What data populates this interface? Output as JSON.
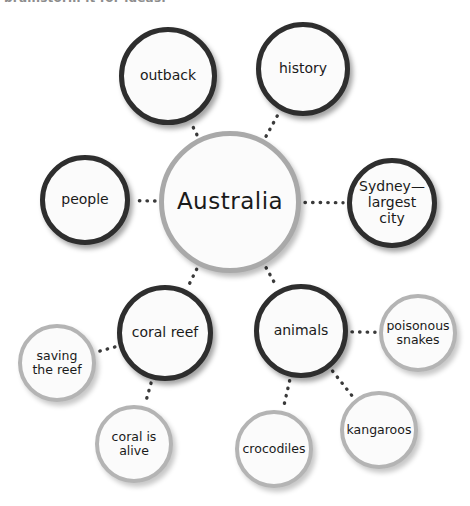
{
  "header": {
    "cropped_text": "brainstorm it for ideas."
  },
  "canvas": {
    "width": 470,
    "height": 506,
    "background": "#ffffff"
  },
  "style": {
    "center_border_color": "#a9a9a9",
    "primary_border_color": "#2e2e2e",
    "leaf_border_color": "#b4b4b4",
    "node_fill": "#fbfbfb",
    "connector_color": "#3a3a3a",
    "text_color": "#1a1a1a"
  },
  "diagram": {
    "type": "mind-map",
    "title": "Australia",
    "nodes": [
      {
        "id": "center",
        "label": "Australia",
        "tier": "center",
        "cx": 230,
        "cy": 202,
        "r": 71
      },
      {
        "id": "outback",
        "label": "outback",
        "tier": "primary",
        "cx": 168,
        "cy": 76,
        "r": 49
      },
      {
        "id": "history",
        "label": "history",
        "tier": "primary",
        "cx": 303,
        "cy": 69,
        "r": 47
      },
      {
        "id": "people",
        "label": "people",
        "tier": "primary",
        "cx": 85,
        "cy": 200,
        "r": 45
      },
      {
        "id": "sydney",
        "label": "Sydney—\nlargest city",
        "tier": "primary",
        "cx": 392,
        "cy": 203,
        "r": 45
      },
      {
        "id": "coralreef",
        "label": "coral reef",
        "tier": "primary",
        "cx": 165,
        "cy": 333,
        "r": 48
      },
      {
        "id": "animals",
        "label": "animals",
        "tier": "primary",
        "cx": 301,
        "cy": 331,
        "r": 47
      },
      {
        "id": "saving",
        "label": "saving\nthe reef",
        "tier": "leaf",
        "cx": 57,
        "cy": 363,
        "r": 39
      },
      {
        "id": "coralalive",
        "label": "coral is\nalive",
        "tier": "leaf",
        "cx": 134,
        "cy": 444,
        "r": 39
      },
      {
        "id": "crocodiles",
        "label": "crocodiles",
        "tier": "leaf",
        "cx": 274,
        "cy": 449,
        "r": 39
      },
      {
        "id": "kangaroos",
        "label": "kangaroos",
        "tier": "leaf",
        "cx": 379,
        "cy": 430,
        "r": 39
      },
      {
        "id": "snakes",
        "label": "poisonous\nsnakes",
        "tier": "leaf",
        "cx": 418,
        "cy": 333,
        "r": 39
      }
    ],
    "links": [
      {
        "from": "center",
        "to": "outback"
      },
      {
        "from": "center",
        "to": "history"
      },
      {
        "from": "center",
        "to": "people"
      },
      {
        "from": "center",
        "to": "sydney"
      },
      {
        "from": "center",
        "to": "coralreef"
      },
      {
        "from": "center",
        "to": "animals"
      },
      {
        "from": "coralreef",
        "to": "saving"
      },
      {
        "from": "coralreef",
        "to": "coralalive"
      },
      {
        "from": "animals",
        "to": "crocodiles"
      },
      {
        "from": "animals",
        "to": "kangaroos"
      },
      {
        "from": "animals",
        "to": "snakes"
      }
    ]
  }
}
